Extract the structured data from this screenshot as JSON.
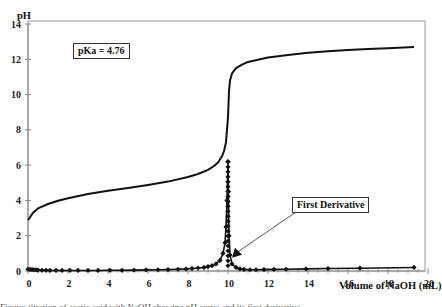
{
  "chart_data": {
    "type": "line",
    "title": "",
    "xlabel": "Volume of NaOH (mL)",
    "ylabel": "pH",
    "xlim": [
      0,
      20
    ],
    "ylim": [
      0,
      14
    ],
    "x_ticks": [
      0,
      2,
      4,
      6,
      8,
      10,
      12,
      14,
      16,
      18,
      20
    ],
    "y_ticks": [
      0,
      2,
      4,
      6,
      8,
      10,
      12,
      14
    ],
    "grid": false,
    "legend": null,
    "annotations": [
      {
        "text": "pKa = 4.76",
        "boxed": true
      },
      {
        "text": "First Derivative",
        "boxed": true,
        "arrow_to": [
          10.05,
          0.6
        ]
      }
    ],
    "series": [
      {
        "name": "pH titration curve",
        "style": "line",
        "x": [
          0,
          0.25,
          0.5,
          1,
          1.5,
          2,
          3,
          4,
          5,
          6,
          7,
          8,
          8.5,
          9,
          9.3,
          9.5,
          9.7,
          9.8,
          9.9,
          9.95,
          10.0,
          10.05,
          10.1,
          10.2,
          10.4,
          10.7,
          11,
          12,
          13,
          14,
          15,
          16,
          17,
          18,
          19.3
        ],
        "y": [
          2.88,
          3.3,
          3.55,
          3.8,
          3.98,
          4.12,
          4.36,
          4.55,
          4.71,
          4.88,
          5.07,
          5.33,
          5.5,
          5.73,
          5.95,
          6.15,
          6.5,
          6.8,
          7.3,
          8.0,
          8.7,
          10.2,
          10.8,
          11.2,
          11.5,
          11.7,
          11.85,
          12.1,
          12.25,
          12.37,
          12.45,
          12.52,
          12.58,
          12.63,
          12.7
        ]
      },
      {
        "name": "First Derivative",
        "style": "line+diamond-markers",
        "x": [
          0,
          0.1,
          0.2,
          0.3,
          0.4,
          0.5,
          0.7,
          0.9,
          1.1,
          1.4,
          1.7,
          2.1,
          2.5,
          3.0,
          3.5,
          4.1,
          4.7,
          5.3,
          5.9,
          6.5,
          7.0,
          7.5,
          7.9,
          8.2,
          8.5,
          8.8,
          9.0,
          9.2,
          9.4,
          9.6,
          9.75,
          9.85,
          9.9,
          9.95,
          10.0,
          10.02,
          10.05,
          10.1,
          10.2,
          10.4,
          10.6,
          10.8,
          11.1,
          11.4,
          11.8,
          12.3,
          12.9,
          13.9,
          15.0,
          16.6,
          19.3
        ],
        "y": [
          0.1,
          0.09,
          0.08,
          0.07,
          0.06,
          0.05,
          0.04,
          0.04,
          0.03,
          0.03,
          0.03,
          0.03,
          0.03,
          0.03,
          0.03,
          0.04,
          0.04,
          0.05,
          0.06,
          0.07,
          0.08,
          0.1,
          0.12,
          0.14,
          0.17,
          0.2,
          0.25,
          0.3,
          0.4,
          0.6,
          1.0,
          1.6,
          2.5,
          4.0,
          6.2,
          4.5,
          2.0,
          0.9,
          0.4,
          0.2,
          0.12,
          0.09,
          0.07,
          0.07,
          0.08,
          0.09,
          0.1,
          0.12,
          0.14,
          0.16,
          0.2
        ]
      }
    ]
  },
  "labels": {
    "y_axis_title": "pH",
    "x_axis_title": "Volume of NaOH (mL)",
    "pka_box": "pKa = 4.76",
    "derivative_box": "First Derivative",
    "caption_clipped": "Figure: titration of acetic acid with NaOH showing pH curve and its first derivative."
  },
  "colors": {
    "curve": "#111111",
    "axis": "#888888",
    "frame": "#999999",
    "arrow": "#444444"
  }
}
